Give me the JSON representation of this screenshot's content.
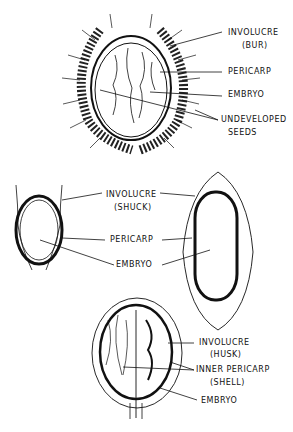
{
  "figure_1": {
    "name": "chestnut bur",
    "labels": {
      "involucre": "INVOLUCRE",
      "involucre_sub": "(BUR)",
      "pericarp": "PERICARP",
      "embryo": "EMBRYO",
      "undeveloped_1": "UNDEVELOPED",
      "undeveloped_2": "SEEDS"
    }
  },
  "figure_2": {
    "name": "hickory/pecan shuck",
    "labels": {
      "involucre": "INVOLUCRE",
      "involucre_sub": "(SHUCK)",
      "pericarp": "PERICARP",
      "embryo": "EMBRYO"
    }
  },
  "figure_3": {
    "name": "walnut husk",
    "labels": {
      "involucre": "INVOLUCRE",
      "involucre_sub": "(HUSK)",
      "inner_pericarp": "INNER PERICARP",
      "inner_pericarp_sub": "(SHELL)",
      "embryo": "EMBRYO"
    }
  },
  "colors": {
    "ink": "#111111",
    "background": "#ffffff"
  }
}
